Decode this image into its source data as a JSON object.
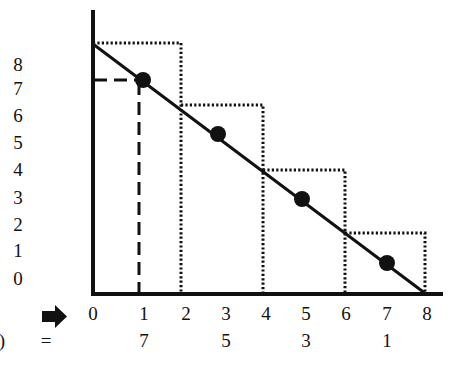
{
  "diagram": {
    "y_tick_labels": [
      "8",
      "7",
      "6",
      "5",
      "4",
      "3",
      "2",
      "1",
      "0"
    ],
    "x_tick_labels": [
      "0",
      "1",
      "2",
      "3",
      "4",
      "5",
      "6",
      "7",
      "8"
    ],
    "row_prefix": ")",
    "equals_sign": "=",
    "arrow_icon": "right-arrow",
    "f_values": [
      "7",
      "5",
      "3",
      "1"
    ],
    "f_value_x_positions": [
      "1",
      "3",
      "5",
      "7"
    ],
    "midpoints": [
      {
        "x": 1,
        "y": 7
      },
      {
        "x": 3,
        "y": 5
      },
      {
        "x": 5,
        "y": 3
      },
      {
        "x": 7,
        "y": 1
      }
    ],
    "line": {
      "from": [
        0,
        8.5
      ],
      "to": [
        8,
        0
      ]
    },
    "rectangles": [
      {
        "x0": 0,
        "x1": 2,
        "height": 8.5
      },
      {
        "x0": 2,
        "x1": 4,
        "height": 6.5
      },
      {
        "x0": 4,
        "x1": 6,
        "height": 4
      },
      {
        "x0": 6,
        "x1": 8,
        "height": 1.5
      }
    ],
    "colors": {
      "ink": "#111111",
      "background": "#ffffff"
    }
  }
}
